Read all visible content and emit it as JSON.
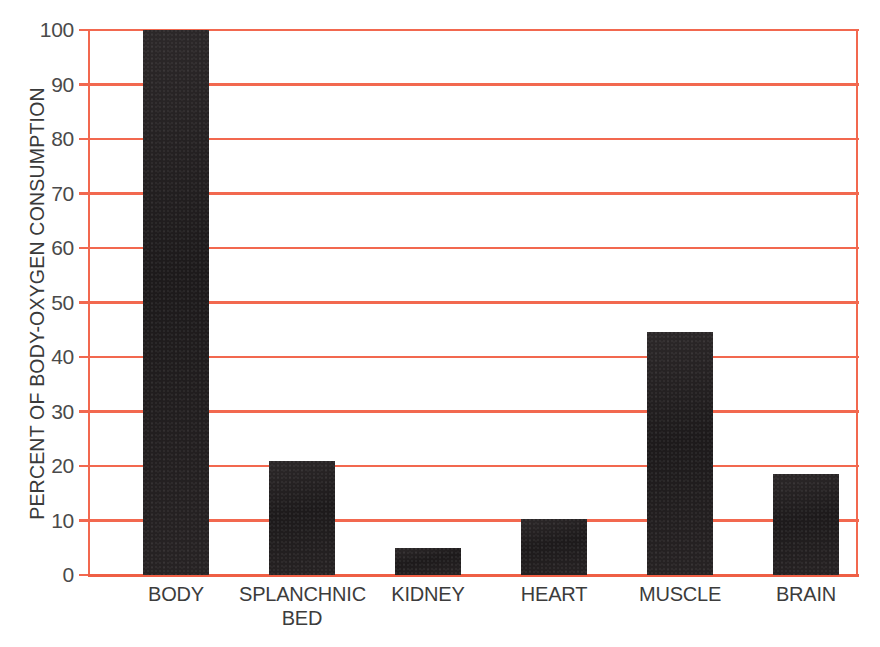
{
  "chart_data": {
    "type": "bar",
    "title": "",
    "subtitle": "",
    "xlabel": "",
    "ylabel": "PERCENT OF BODY-OXYGEN CONSUMPTION",
    "categories": [
      "BODY",
      "SPLANCHNIC\nBED",
      "KIDNEY",
      "HEART",
      "MUSCLE",
      "BRAIN"
    ],
    "values": [
      100,
      21,
      5,
      10.2,
      44.5,
      18.5
    ],
    "ylim": [
      0,
      100
    ],
    "ytick_labels": [
      "0",
      "10",
      "20",
      "30",
      "40",
      "50",
      "60",
      "70",
      "80",
      "90",
      "100"
    ],
    "ytick_values": [
      0,
      10,
      20,
      30,
      40,
      50,
      60,
      70,
      80,
      90,
      100
    ],
    "grid": true,
    "legend": "none",
    "colors": {
      "bar": "#231f20",
      "gridline": "#f2684f",
      "axis": "#f2684f",
      "text": "#3c3c3c",
      "background": "#ffffff"
    }
  },
  "caption": {
    "text": ""
  }
}
